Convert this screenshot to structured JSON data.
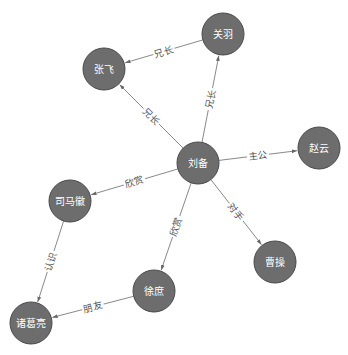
{
  "diagram": {
    "type": "directed-graph",
    "style": {
      "node_fill": "#6d6d6d",
      "node_stroke": "#4a4a4a",
      "node_text": "#ffffff",
      "edge_color": "#7a7a7a",
      "edge_label_color": "#555555",
      "node_radius": 21
    },
    "nodes": [
      {
        "id": "liubei",
        "label": "刘备",
        "x": 198,
        "y": 163
      },
      {
        "id": "zhangfei",
        "label": "张飞",
        "x": 104,
        "y": 69
      },
      {
        "id": "guanyu",
        "label": "关羽",
        "x": 223,
        "y": 34
      },
      {
        "id": "zhaoyun",
        "label": "赵云",
        "x": 319,
        "y": 148
      },
      {
        "id": "simahui",
        "label": "司马徽",
        "x": 70,
        "y": 201
      },
      {
        "id": "caocao",
        "label": "曹操",
        "x": 275,
        "y": 262
      },
      {
        "id": "xushu",
        "label": "徐庶",
        "x": 154,
        "y": 291
      },
      {
        "id": "zhugeliang",
        "label": "诸葛亮",
        "x": 31,
        "y": 323
      }
    ],
    "edges": [
      {
        "source": "guanyu",
        "target": "zhangfei",
        "label": "兄长"
      },
      {
        "source": "liubei",
        "target": "zhangfei",
        "label": "兄长"
      },
      {
        "source": "liubei",
        "target": "guanyu",
        "label": "兄长"
      },
      {
        "source": "liubei",
        "target": "zhaoyun",
        "label": "主公"
      },
      {
        "source": "liubei",
        "target": "simahui",
        "label": "欣赏"
      },
      {
        "source": "liubei",
        "target": "xushu",
        "label": "欣赏"
      },
      {
        "source": "liubei",
        "target": "caocao",
        "label": "对手"
      },
      {
        "source": "simahui",
        "target": "zhugeliang",
        "label": "认识"
      },
      {
        "source": "xushu",
        "target": "zhugeliang",
        "label": "朋友"
      }
    ]
  }
}
